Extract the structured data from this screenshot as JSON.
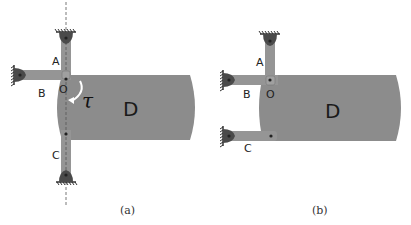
{
  "figure": {
    "panels": [
      {
        "id": "a",
        "caption": "(a)",
        "body_label": "D",
        "link_labels": {
          "A": "A",
          "B": "B",
          "C": "C"
        },
        "joint_label": "O",
        "torque_label": "τ",
        "has_symmetry_axis": true
      },
      {
        "id": "b",
        "caption": "(b)",
        "body_label": "D",
        "link_labels": {
          "A": "A",
          "B": "B",
          "C": "C"
        },
        "joint_label": "O",
        "has_symmetry_axis": false
      }
    ],
    "colors": {
      "body": "#8c8c8c",
      "link": "#959595",
      "pivot": "#4a4a4a",
      "ground": "#333333",
      "torque_arrow": "#ffffff",
      "axis": "#555555"
    }
  }
}
